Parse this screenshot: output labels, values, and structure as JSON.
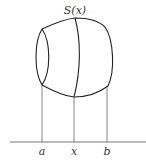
{
  "diagram": {
    "type": "solid-cross-section",
    "title_label": "S(x)",
    "axis_labels": {
      "a": "a",
      "x": "x",
      "b": "b"
    },
    "colors": {
      "stroke_outline": "#222222",
      "stroke_guides": "#555555",
      "background": "#ffffff"
    }
  }
}
